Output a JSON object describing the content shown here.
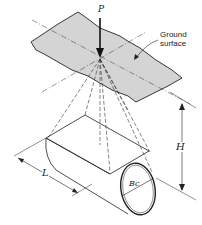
{
  "diagram": {
    "labels": {
      "load": "P",
      "ground_surface_line1": "Ground",
      "ground_surface_line2": "surface",
      "height": "H",
      "length": "L",
      "diameter": "Bc"
    },
    "colors": {
      "ground_fill": "#d4d4d4",
      "line": "#222222",
      "background": "#ffffff"
    }
  }
}
